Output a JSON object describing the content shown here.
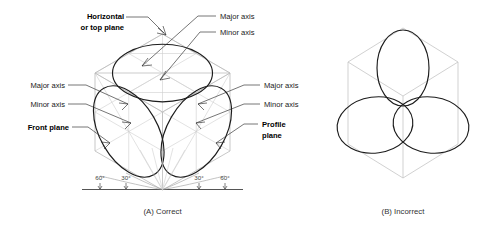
{
  "figure": {
    "title_alt": "Isometric ellipse orientation on the three principal planes",
    "background": "#ffffff",
    "ink": "#1c1c1c",
    "construction_color": "#c9c9c9"
  },
  "labels": {
    "horizontal_plane": {
      "line1": "Horizontal",
      "line2": "or top plane",
      "bold": true
    },
    "top_major_axis": "Major axis",
    "top_minor_axis": "Minor axis",
    "left_major_axis": "Major axis",
    "left_minor_axis": "Minor axis",
    "front_plane": {
      "line1": "Front plane",
      "bold": true
    },
    "right_major_axis": "Major axis",
    "right_minor_axis": "Minor axis",
    "profile_plane": {
      "line1": "Profile",
      "line2": "plane",
      "bold": true
    }
  },
  "angles": {
    "items": [
      {
        "id": "left-outer",
        "text": "60°"
      },
      {
        "id": "left-inner",
        "text": "30°"
      },
      {
        "id": "right-inner",
        "text": "30°"
      },
      {
        "id": "right-outer",
        "text": "60°"
      }
    ]
  },
  "captions": {
    "a": "(A) Correct",
    "b": "(B) Incorrect"
  },
  "panel_a": {
    "name": "correct-isometric-cube",
    "ellipses": [
      {
        "plane": "top",
        "major_axis_deg": 0,
        "note": "major axis horizontal, perpendicular to vertical cube axis"
      },
      {
        "plane": "front",
        "major_axis_deg": 60,
        "note": "major axis perpendicular to the front-plane normal"
      },
      {
        "plane": "profile",
        "major_axis_deg": -60,
        "note": "major axis perpendicular to the profile-plane normal"
      }
    ]
  },
  "panel_b": {
    "name": "incorrect-isometric-cube",
    "ellipses": [
      {
        "plane": "top",
        "major_axis_deg": 90,
        "note": "incorrectly drawn upright"
      },
      {
        "plane": "front",
        "major_axis_deg": 20,
        "note": "incorrectly tilted"
      },
      {
        "plane": "profile",
        "major_axis_deg": -20,
        "note": "incorrectly tilted"
      }
    ]
  }
}
